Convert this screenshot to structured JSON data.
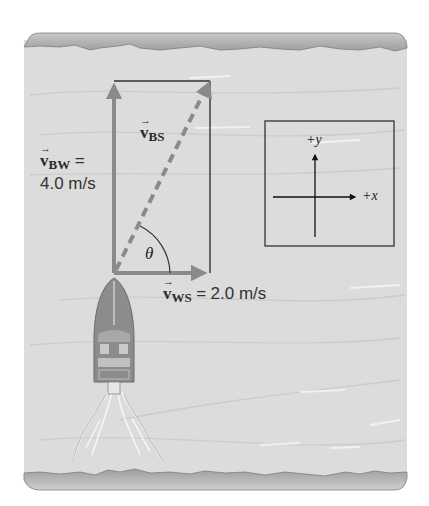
{
  "figure": {
    "colors": {
      "background": "#ffffff",
      "water": "#dcdcdc",
      "bank": "#a9a9a9",
      "vector_gray": "#8a8a8a",
      "line_dark": "#333333"
    }
  },
  "vectors": {
    "v_bw": {
      "symbol": "v",
      "subscript": "BW",
      "equals": "=",
      "value": "4.0 m/s",
      "direction": "+y"
    },
    "v_bs": {
      "symbol": "v",
      "subscript": "BS",
      "style": "dashed",
      "direction": "resultant"
    },
    "v_ws": {
      "symbol": "v",
      "subscript": "WS",
      "equals": "=",
      "value": "2.0 m/s",
      "direction": "+x"
    }
  },
  "angle": {
    "label": "θ"
  },
  "axes_inset": {
    "x_label": "+x",
    "y_label": "+y"
  },
  "vector_arrow_glyph": "→"
}
